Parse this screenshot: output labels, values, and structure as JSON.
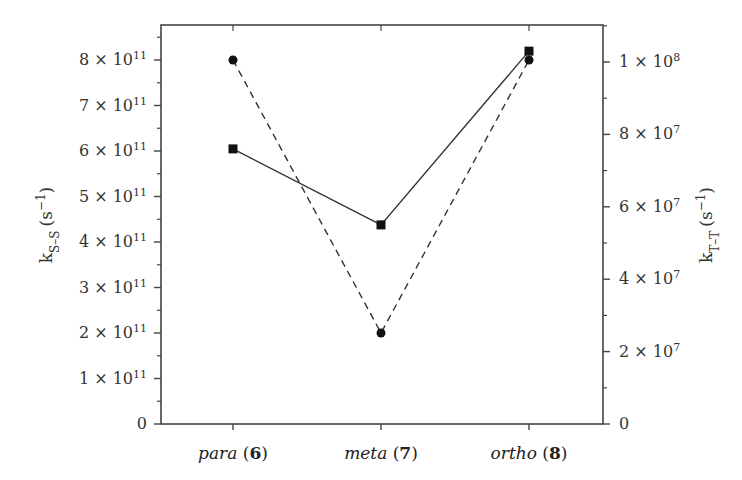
{
  "chart_data": {
    "type": "line",
    "title": "",
    "categories": [
      "para (6)",
      "meta (7)",
      "ortho (8)"
    ],
    "category_parts": [
      {
        "name": "para",
        "num": "6"
      },
      {
        "name": "meta",
        "num": "7"
      },
      {
        "name": "ortho",
        "num": "8"
      }
    ],
    "xlabel": "",
    "axis_series_mapping_note": "Assumed, not visible in image: no legend or label ties either series to either axis. Series-to-axis assignment below is inferred from which scale gives rounder values.",
    "left_axis": {
      "label_main": "k",
      "label_sub": "S–S",
      "label_unit": "(s",
      "label_unit_sup": "−1",
      "label_close": ")",
      "ylim": [
        0,
        850000000000.0
      ],
      "ticks": [
        {
          "value": 0,
          "mant": "0",
          "exp": ""
        },
        {
          "value": 100000000000.0,
          "mant": "1 × 10",
          "exp": "11"
        },
        {
          "value": 200000000000.0,
          "mant": "2 × 10",
          "exp": "11"
        },
        {
          "value": 300000000000.0,
          "mant": "3 × 10",
          "exp": "11"
        },
        {
          "value": 400000000000.0,
          "mant": "4 × 10",
          "exp": "11"
        },
        {
          "value": 500000000000.0,
          "mant": "5 × 10",
          "exp": "11"
        },
        {
          "value": 600000000000.0,
          "mant": "6 × 10",
          "exp": "11"
        },
        {
          "value": 700000000000.0,
          "mant": "7 × 10",
          "exp": "11"
        },
        {
          "value": 800000000000.0,
          "mant": "8 × 10",
          "exp": "11"
        }
      ]
    },
    "right_axis": {
      "label_main": "k",
      "label_sub": "T–T",
      "label_unit": "(s",
      "label_unit_sup": "−1",
      "label_close": ")",
      "ylim": [
        0,
        110000000.0
      ],
      "ticks": [
        {
          "value": 0,
          "mant": "0",
          "exp": ""
        },
        {
          "value": 20000000.0,
          "mant": "2 × 10",
          "exp": "7"
        },
        {
          "value": 40000000.0,
          "mant": "4 × 10",
          "exp": "7"
        },
        {
          "value": 60000000.0,
          "mant": "6 × 10",
          "exp": "7"
        },
        {
          "value": 80000000.0,
          "mant": "8 × 10",
          "exp": "7"
        },
        {
          "value": 100000000.0,
          "mant": "1 × 10",
          "exp": "8"
        }
      ]
    },
    "series": [
      {
        "name": "k_S-S",
        "axis": "left",
        "axis_assignment": "assumed",
        "marker": "circle",
        "line": "dashed",
        "values": [
          800000000000.0,
          200000000000.0,
          800000000000.0
        ]
      },
      {
        "name": "k_T-T",
        "axis": "right",
        "axis_assignment": "assumed",
        "marker": "square",
        "line": "solid",
        "values": [
          76000000.0,
          55000000.0,
          103000000.0
        ]
      }
    ],
    "grid": false,
    "legend": "none",
    "colors": {
      "line": "#333333",
      "marker": "#111111",
      "axis": "#444444"
    }
  }
}
